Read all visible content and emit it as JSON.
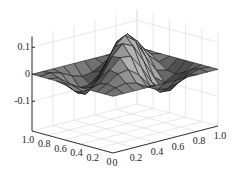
{
  "chart_data": {
    "type": "surface3d",
    "title": "",
    "xlabel": "",
    "ylabel": "",
    "zlabel": "",
    "x_ticks": [
      "0",
      "0.2",
      "0.4",
      "0.6",
      "0.8",
      "1.0"
    ],
    "y_ticks": [
      "0",
      "0.2",
      "0.4",
      "0.6",
      "0.8",
      "1.0"
    ],
    "z_ticks": [
      "-0.1",
      "0",
      "0.1"
    ],
    "xlim": [
      0,
      1
    ],
    "ylim": [
      0,
      1
    ],
    "zlim": [
      -0.21,
      0.14
    ],
    "grid": true,
    "colormap": "gray",
    "grid_size": 11,
    "surface_description": "z = 0.15*sin(pi*x)*sin(pi*y)*cos(2*pi*(x-y)) style pattern: peaks at back and front-center, troughs at left and right corners, near zero along edges"
  },
  "colors": {
    "face_light": "#9a9a9a",
    "face_dark": "#3a3a3a",
    "edge": "#1a1a1a",
    "grid": "#dcdcdc",
    "axis": "#333333"
  }
}
